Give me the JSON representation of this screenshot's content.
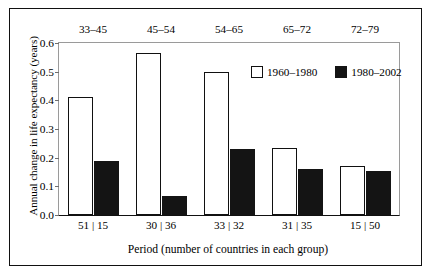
{
  "chart_data": {
    "type": "bar",
    "title": "",
    "xlabel": "Period (number of countries in each group)",
    "ylabel": "Annual change in life expectancy (years)",
    "ylim": [
      0.0,
      0.6
    ],
    "yticks": [
      "0.0",
      "0.1",
      "0.2",
      "0.3",
      "0.4",
      "0.5",
      "0.6"
    ],
    "ytick_values": [
      0.0,
      0.1,
      0.2,
      0.3,
      0.4,
      0.5,
      0.6
    ],
    "grid": false,
    "legend_position": "inside-top-center",
    "categories": [
      "51 | 15",
      "30 | 36",
      "33 | 32",
      "31 | 35",
      "15 | 50"
    ],
    "top_labels": [
      "33–45",
      "45–54",
      "54–65",
      "65–72",
      "72–79"
    ],
    "series": [
      {
        "name": "1960–1980",
        "color": "#ffffff",
        "edge_color": "#111111",
        "values": [
          0.41,
          0.565,
          0.5,
          0.235,
          0.17
        ]
      },
      {
        "name": "1980–2002",
        "color": "#141414",
        "edge_color": "#141414",
        "values": [
          0.19,
          0.065,
          0.23,
          0.16,
          0.155
        ]
      }
    ]
  },
  "figure": {
    "border_color": "#111111",
    "plot_frame_color": "#9a9a9a",
    "background": "#ffffff"
  }
}
